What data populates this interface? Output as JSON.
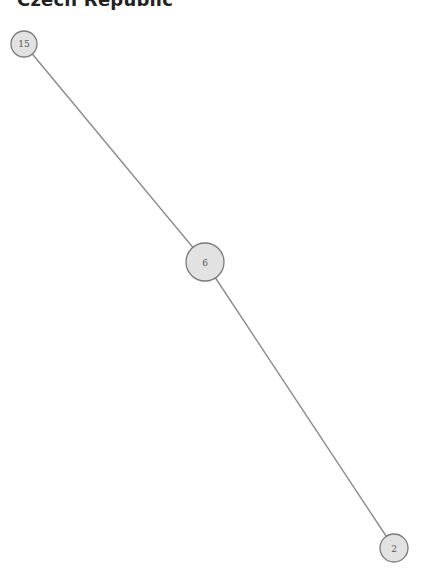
{
  "title": "Czech Republic",
  "graph": {
    "nodes": [
      {
        "id": "15",
        "label": "15",
        "x": 24,
        "y": 44,
        "r": 13
      },
      {
        "id": "6",
        "label": "6",
        "x": 205,
        "y": 262,
        "r": 19
      },
      {
        "id": "2",
        "label": "2",
        "x": 394,
        "y": 548,
        "r": 14
      }
    ],
    "edges": [
      {
        "source": "15",
        "target": "6"
      },
      {
        "source": "6",
        "target": "2"
      }
    ],
    "colors": {
      "node_fill": "#e2e2e2",
      "node_stroke": "#7a7a7a",
      "edge": "#8a8a8a",
      "label": "#555555"
    }
  }
}
